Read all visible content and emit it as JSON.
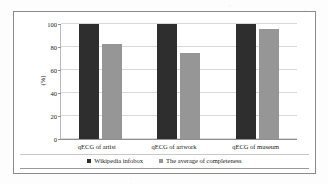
{
  "chart_data": {
    "type": "bar",
    "title": "",
    "xlabel": "",
    "ylabel": "(%)",
    "categories": [
      "qECG of artist",
      "qECG of artwork",
      "qECG of museum"
    ],
    "series": [
      {
        "name": "Wikipedia infobox",
        "color": "#2e2e2e",
        "values": [
          100,
          100,
          100
        ]
      },
      {
        "name": "The average of completeness",
        "color": "#969696",
        "values": [
          83,
          75,
          96
        ]
      }
    ],
    "ylim": [
      0,
      100
    ],
    "yticks": [
      0,
      20,
      40,
      60,
      80,
      100
    ],
    "ytick_labels": [
      "0",
      "20",
      "40",
      "60",
      "80",
      "100"
    ],
    "grid": true,
    "legend_position": "bottom"
  }
}
